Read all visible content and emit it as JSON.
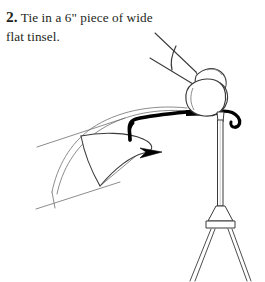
{
  "page": {
    "background_color": "#ffffff",
    "width": 265,
    "height": 282
  },
  "caption": {
    "step_number": "2.",
    "text": "Tie in a 6\" piece of wide flat tinsel.",
    "line_1": "Tie in a 6\" piece",
    "line_2": "of wide flat tinsel.",
    "text_color": "#231f20"
  },
  "illustration": {
    "name": "fly-tying-step-diagram",
    "description": "Line drawing of a hand holding a strip of flat tinsel against a fishhook mounted in a fly-tying vise.",
    "ink_color": "#000000",
    "line_color": "#3a3a3a",
    "light_line_color": "#6e6e6e",
    "fill_color": "#ffffff",
    "parts": [
      {
        "name": "index-finger",
        "label": "Index finger"
      },
      {
        "name": "thumb",
        "label": "Thumb"
      },
      {
        "name": "fishhook",
        "label": "Fishhook"
      },
      {
        "name": "hook-eye",
        "label": "Hook eye"
      },
      {
        "name": "hook-point",
        "label": "Hook point and barb"
      },
      {
        "name": "tinsel-strip",
        "label": "Flat tinsel strip"
      },
      {
        "name": "vise-jaw",
        "label": "Vise jaw"
      },
      {
        "name": "vise-stem",
        "label": "Vise stem"
      },
      {
        "name": "vise-base",
        "label": "Vise base"
      },
      {
        "name": "vise-legs",
        "label": "Vise legs"
      }
    ]
  }
}
